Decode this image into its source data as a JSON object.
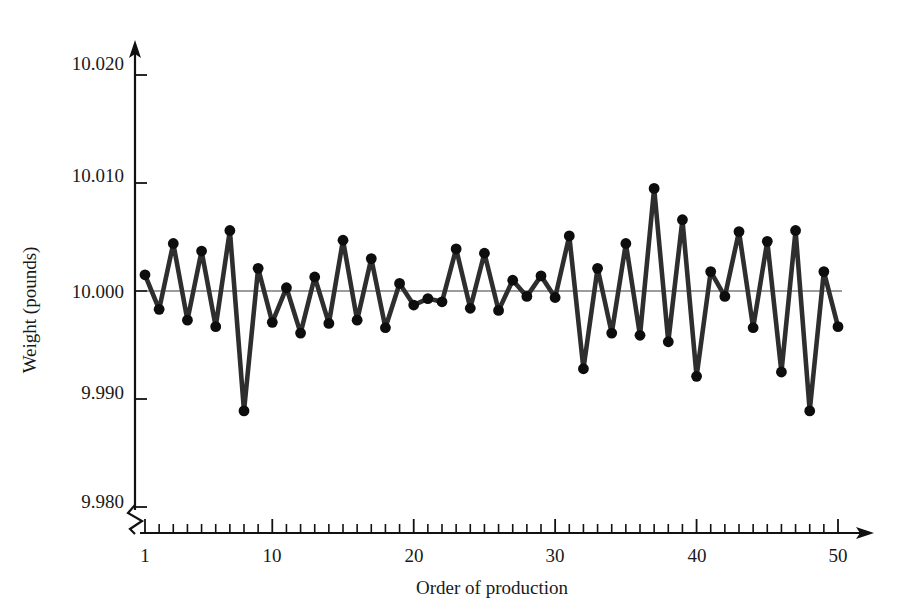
{
  "chart_data": {
    "type": "line",
    "title": "",
    "xlabel": "Order of production",
    "ylabel": "Weight (pounds)",
    "xlim": [
      1,
      50
    ],
    "ylim": [
      9.98,
      10.02
    ],
    "grid": false,
    "legend": null,
    "reference_line": {
      "label": "10.000",
      "value": 10.0
    },
    "axis_break": {
      "axis": "y",
      "below": 9.98,
      "present": true
    },
    "y_ticks": [
      "9.980",
      "9.990",
      "10.000",
      "10.010",
      "10.020"
    ],
    "y_tick_values": [
      9.98,
      9.99,
      10.0,
      10.01,
      10.02
    ],
    "x_ticks": [
      "1",
      "10",
      "20",
      "30",
      "40",
      "50"
    ],
    "x_tick_values": [
      1,
      10,
      20,
      30,
      40,
      50
    ],
    "x_minor_tick_step": 1,
    "x": [
      1,
      2,
      3,
      4,
      5,
      6,
      7,
      8,
      9,
      10,
      11,
      12,
      13,
      14,
      15,
      16,
      17,
      18,
      19,
      20,
      21,
      22,
      23,
      24,
      25,
      26,
      27,
      28,
      29,
      30,
      31,
      32,
      33,
      34,
      35,
      36,
      37,
      38,
      39,
      40,
      41,
      42,
      43,
      44,
      45,
      46,
      47,
      48,
      49,
      50
    ],
    "values": [
      10.0015,
      9.9983,
      10.0044,
      9.9973,
      10.0037,
      9.9967,
      10.0056,
      9.9889,
      10.0021,
      9.9971,
      10.0003,
      9.9961,
      10.0013,
      9.997,
      10.0047,
      9.9973,
      10.003,
      9.9966,
      10.0007,
      9.9987,
      9.9993,
      9.999,
      10.0039,
      9.9984,
      10.0035,
      9.9982,
      10.001,
      9.9995,
      10.0014,
      9.9994,
      10.0051,
      9.9928,
      10.0021,
      9.9961,
      10.0044,
      9.9959,
      10.0095,
      9.9953,
      10.0066,
      9.9921,
      10.0018,
      9.9995,
      10.0055,
      9.9966,
      10.0046,
      9.9925,
      10.0056,
      9.9889,
      10.0018,
      9.9967
    ],
    "series": [
      {
        "name": "Weight",
        "color": "#2e2e2e",
        "marker": "circle"
      }
    ]
  },
  "colors": {
    "line": "#2e2e2e",
    "marker": "#0d0d0d",
    "axis": "#111111",
    "reference": "#3a3a3a",
    "text": "#1a1a1a",
    "background": "#ffffff"
  }
}
